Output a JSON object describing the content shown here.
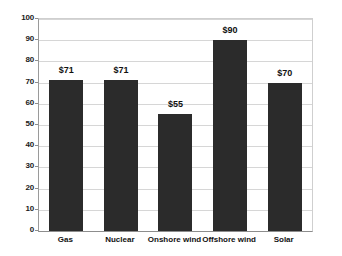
{
  "chart_data": {
    "type": "bar",
    "title": "",
    "subtitle": "",
    "xlabel": "",
    "ylabel": "",
    "categories": [
      "Gas",
      "Nuclear",
      "Onshore wind",
      "Offshore wind",
      "Solar"
    ],
    "values": [
      71,
      71,
      55,
      90,
      70
    ],
    "data_labels": [
      "$71",
      "$71",
      "$55",
      "$90",
      "$70"
    ],
    "ylim": [
      0,
      100
    ],
    "ytick_labels": [
      "0",
      "10",
      "20",
      "30",
      "40",
      "50",
      "60",
      "70",
      "80",
      "90",
      "100"
    ],
    "ytick_values": [
      0,
      10,
      20,
      30,
      40,
      50,
      60,
      70,
      80,
      90,
      100
    ],
    "grid": true,
    "grid_axis": "y",
    "legend": false,
    "legend_position": "none",
    "bar_color": "#2b2b2b",
    "gridline_color": "#d6d6d6",
    "axis_color": "#8d8d8d",
    "background_color": "#ffffff"
  }
}
